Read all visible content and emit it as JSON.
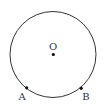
{
  "diagram": {
    "type": "geometry",
    "circle": {
      "cx": 53,
      "cy": 54.5,
      "r": 43,
      "stroke": "#333333"
    },
    "points": [
      {
        "id": "O",
        "label": "O",
        "x": 53.3,
        "y": 54.5,
        "label_x": 53,
        "label_y": 50
      },
      {
        "id": "A",
        "label": "A",
        "x": 26.7,
        "y": 87.8,
        "label_x": 22,
        "label_y": 100
      },
      {
        "id": "B",
        "label": "B",
        "x": 81.2,
        "y": 88.3,
        "label_x": 86,
        "label_y": 100
      }
    ]
  }
}
